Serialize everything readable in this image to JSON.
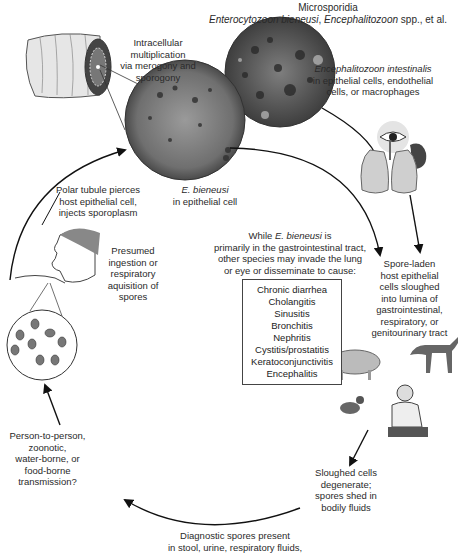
{
  "title": {
    "line1": "Microsporidia",
    "line2_italic_a": "Enterocytozoon bieneusi",
    "line2_sep": ", ",
    "line2_italic_b": "Encephalitozoon",
    "line2_rest": " spp., et al."
  },
  "labels": {
    "intracellular": [
      "Intracellular",
      "multiplication",
      "via merogony and",
      "sporogony"
    ],
    "e_intestinalis": {
      "italic": "Encephalitozoon intestinalis",
      "lines": [
        "in epithelial cells, endothelial",
        "cells, or macrophages"
      ]
    },
    "e_bieneusi": {
      "italic": "E. bieneusi",
      "line": "in epithelial cell"
    },
    "polar_tubule": [
      "Polar tubule pierces",
      "host epithelial cell,",
      "injects sporoplasm"
    ],
    "presumed": [
      "Presumed",
      "ingestion or",
      "respiratory",
      "aquisition of",
      "spores"
    ],
    "while": {
      "pre": "While ",
      "italic": "E. bieneusi",
      "post": " is",
      "lines": [
        "primarily in the gastrointestinal tract,",
        "other species may invade the lung",
        "or eye or disseminate to cause:"
      ]
    },
    "spore_laden": [
      "Spore-laden",
      "host epithelial",
      "cells sloughed",
      "into lumina of",
      "gastrointestinal,",
      "respiratory, or",
      "genitourinary tract"
    ],
    "transmission": [
      "Person-to-person,",
      "zoonotic,",
      "water-borne, or",
      "food-borne",
      "transmission?"
    ],
    "sloughed": [
      "Sloughed cells",
      "degenerate;",
      "spores shed in",
      "bodily fluids"
    ],
    "diagnostic": [
      "Diagnostic spores present",
      "in stool, urine, respiratory fluids,"
    ]
  },
  "diseases": [
    "Chronic diarrhea",
    "Cholangitis",
    "Sinusitis",
    "Bronchitis",
    "Nephritis",
    "Cystitis/prostatitis",
    "Keratoconjunctivitis",
    "Encephalitis"
  ],
  "icons": [
    "intestine-icon",
    "cell-micrograph-icon",
    "eye-icon",
    "kidney-icon",
    "lungs-icon",
    "pig-icon",
    "dog-icon",
    "pigeon-icon",
    "man-icon",
    "human-head-icon",
    "spores-icon"
  ]
}
